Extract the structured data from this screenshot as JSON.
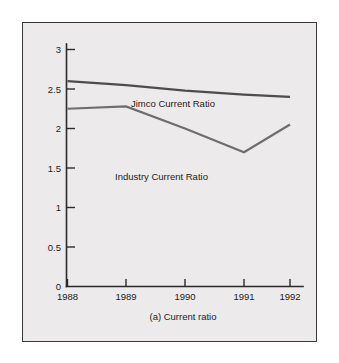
{
  "figure": {
    "caption": "(a) Current ratio",
    "frame_color": "#3a3a3a",
    "plot_background": "#eceaea",
    "page_background": "#ffffff"
  },
  "axes": {
    "y_ticks": [
      "0",
      "0.5",
      "1",
      "1.5",
      "2",
      "2.5",
      "3"
    ],
    "x_ticks": [
      "1988",
      "1989",
      "1990",
      "1991",
      "1992"
    ],
    "axis_color": "#2b2b2b"
  },
  "series_labels": {
    "jimco": "Jimco Current Ratio",
    "industry": "Industry Current Ratio"
  },
  "chart_data": {
    "type": "line",
    "title": "",
    "subtitle": "",
    "caption": "(a) Current ratio",
    "xlabel": "",
    "ylabel": "",
    "x": [
      "1988",
      "1989",
      "1990",
      "1991",
      "1992"
    ],
    "categories": [
      "1988",
      "1989",
      "1990",
      "1991",
      "1992"
    ],
    "series": [
      {
        "name": "Jimco Current Ratio",
        "values": [
          2.6,
          2.55,
          2.48,
          2.43,
          2.4
        ],
        "color": "#4d4d4d",
        "label_text": "Jimco Current Ratio"
      },
      {
        "name": "Industry Current Ratio",
        "values": [
          2.25,
          2.28,
          2.0,
          1.7,
          2.05
        ],
        "color": "#6e6e6e",
        "label_text": "Industry Current Ratio"
      }
    ],
    "ylim": [
      0,
      3.2
    ],
    "yticks": [
      0,
      0.5,
      1,
      1.5,
      2,
      2.5,
      3
    ],
    "ytick_labels": [
      "0",
      "0.5",
      "1",
      "1.5",
      "2",
      "2.5",
      "3"
    ],
    "xlim": [
      "1988",
      "1992"
    ],
    "grid": false,
    "legend": "inline-annotations",
    "legend_position": "in-plot"
  }
}
